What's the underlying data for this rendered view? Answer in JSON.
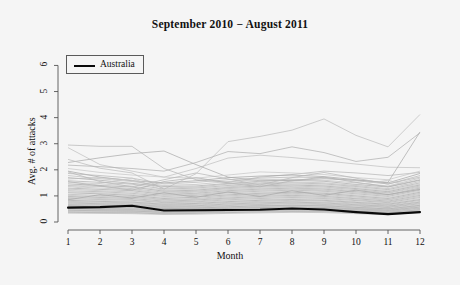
{
  "chart_data": {
    "type": "line",
    "title": "September 2010 − August 2011",
    "xlabel": "Month",
    "ylabel": "Avg. # of attacks",
    "xlim": [
      1,
      12
    ],
    "ylim": [
      0,
      6.4
    ],
    "xticks": [
      "1",
      "2",
      "3",
      "4",
      "5",
      "6",
      "7",
      "8",
      "9",
      "10",
      "11",
      "12"
    ],
    "yticks": [
      "0",
      "1",
      "2",
      "3",
      "4",
      "5",
      "6"
    ],
    "grid": false,
    "legend": {
      "position": "top-left",
      "entries": [
        {
          "name": "Australia",
          "color": "#0a0a0a",
          "width": 2.2
        }
      ]
    },
    "x": [
      1,
      2,
      3,
      4,
      5,
      6,
      7,
      8,
      9,
      10,
      11,
      12
    ],
    "highlight_series": {
      "name": "Australia",
      "color": "#0a0a0a",
      "values": [
        0.55,
        0.57,
        0.62,
        0.44,
        0.45,
        0.46,
        0.47,
        0.52,
        0.48,
        0.38,
        0.3,
        0.38
      ]
    },
    "series": [
      {
        "name": "Country 01",
        "values": [
          2.95,
          2.9,
          2.9,
          2.05,
          1.62,
          1.52,
          1.72,
          1.82,
          1.95,
          1.88,
          1.78,
          1.9
        ]
      },
      {
        "name": "Country 02",
        "values": [
          2.85,
          2.2,
          1.95,
          1.72,
          2.05,
          2.45,
          2.56,
          2.47,
          2.35,
          2.22,
          2.1,
          2.08
        ]
      },
      {
        "name": "Country 03",
        "values": [
          2.28,
          2.46,
          2.62,
          2.72,
          2.2,
          1.72,
          1.58,
          1.6,
          1.66,
          1.6,
          1.52,
          3.45
        ]
      },
      {
        "name": "Country 04",
        "values": [
          2.4,
          2.06,
          1.88,
          1.26,
          1.85,
          3.08,
          3.28,
          3.52,
          3.95,
          3.32,
          2.88,
          4.12
        ]
      },
      {
        "name": "Country 05",
        "values": [
          2.18,
          2.12,
          2.05,
          1.95,
          2.28,
          2.7,
          2.62,
          2.88,
          2.66,
          2.32,
          2.48,
          3.42
        ]
      },
      {
        "name": "Country 06",
        "values": [
          2.05,
          1.9,
          1.8,
          1.72,
          1.68,
          1.8,
          1.92,
          1.88,
          1.82,
          1.7,
          1.62,
          1.95
        ]
      },
      {
        "name": "Country 07",
        "values": [
          1.95,
          1.72,
          1.58,
          1.5,
          1.58,
          1.7,
          1.76,
          1.8,
          1.74,
          1.62,
          1.5,
          1.86
        ]
      },
      {
        "name": "Country 08",
        "values": [
          1.86,
          1.78,
          1.68,
          1.46,
          1.52,
          1.62,
          1.68,
          1.72,
          1.7,
          1.58,
          1.46,
          1.72
        ]
      },
      {
        "name": "Country 09",
        "values": [
          1.78,
          1.66,
          1.55,
          1.4,
          1.44,
          1.55,
          1.62,
          1.64,
          1.6,
          1.5,
          1.38,
          1.68
        ]
      },
      {
        "name": "Country 10",
        "values": [
          1.7,
          1.6,
          1.48,
          1.36,
          1.38,
          1.48,
          1.56,
          1.6,
          1.56,
          1.44,
          1.34,
          1.6
        ]
      },
      {
        "name": "Country 11",
        "values": [
          1.65,
          1.7,
          1.6,
          1.3,
          1.34,
          1.45,
          1.5,
          1.54,
          1.5,
          1.4,
          1.28,
          1.55
        ]
      },
      {
        "name": "Country 12",
        "values": [
          1.58,
          1.52,
          1.45,
          1.26,
          1.3,
          1.4,
          1.46,
          1.5,
          1.46,
          1.36,
          1.24,
          1.5
        ]
      },
      {
        "name": "Country 13",
        "values": [
          1.52,
          1.46,
          1.38,
          1.22,
          1.26,
          1.36,
          1.42,
          1.46,
          1.42,
          1.32,
          1.2,
          1.46
        ]
      },
      {
        "name": "Country 14",
        "values": [
          1.46,
          1.4,
          1.34,
          1.18,
          1.22,
          1.32,
          1.38,
          1.42,
          1.38,
          1.28,
          1.16,
          1.42
        ]
      },
      {
        "name": "Country 15",
        "values": [
          1.4,
          1.36,
          1.28,
          1.14,
          1.18,
          1.28,
          1.34,
          1.38,
          1.34,
          1.24,
          1.12,
          1.38
        ]
      },
      {
        "name": "Country 16",
        "values": [
          1.36,
          1.3,
          1.24,
          1.1,
          1.15,
          1.24,
          1.3,
          1.34,
          1.3,
          1.2,
          1.1,
          1.34
        ]
      },
      {
        "name": "Country 17",
        "values": [
          1.3,
          1.25,
          1.2,
          1.06,
          1.1,
          1.2,
          1.26,
          1.3,
          1.26,
          1.16,
          1.05,
          1.3
        ]
      },
      {
        "name": "Country 18",
        "values": [
          1.26,
          1.2,
          1.15,
          1.02,
          1.06,
          1.16,
          1.22,
          1.26,
          1.22,
          1.12,
          1.02,
          1.26
        ]
      },
      {
        "name": "Country 19",
        "values": [
          1.2,
          1.16,
          1.1,
          0.98,
          1.02,
          1.12,
          1.18,
          1.22,
          1.18,
          1.08,
          0.98,
          1.22
        ]
      },
      {
        "name": "Country 20",
        "values": [
          1.16,
          1.12,
          1.06,
          0.94,
          0.98,
          1.08,
          1.14,
          1.18,
          1.14,
          1.04,
          0.94,
          1.18
        ]
      },
      {
        "name": "Country 21",
        "values": [
          1.12,
          1.08,
          1.02,
          0.9,
          0.95,
          1.04,
          1.1,
          1.14,
          1.1,
          1.0,
          0.9,
          1.14
        ]
      },
      {
        "name": "Country 22",
        "values": [
          1.06,
          1.02,
          0.98,
          0.86,
          0.9,
          1.0,
          1.06,
          1.1,
          1.06,
          0.96,
          0.86,
          1.1
        ]
      },
      {
        "name": "Country 23",
        "values": [
          1.02,
          0.98,
          0.94,
          0.84,
          0.87,
          0.96,
          1.02,
          1.06,
          1.02,
          0.92,
          0.84,
          1.06
        ]
      },
      {
        "name": "Country 24",
        "values": [
          0.98,
          0.94,
          0.9,
          0.8,
          0.84,
          0.92,
          0.98,
          1.02,
          0.98,
          0.89,
          0.8,
          1.02
        ]
      },
      {
        "name": "Country 25",
        "values": [
          0.94,
          0.9,
          0.86,
          0.77,
          0.8,
          0.89,
          0.94,
          0.98,
          0.94,
          0.85,
          0.77,
          0.98
        ]
      },
      {
        "name": "Country 26",
        "values": [
          0.9,
          0.86,
          0.83,
          0.74,
          0.77,
          0.85,
          0.9,
          0.94,
          0.9,
          0.82,
          0.74,
          0.94
        ]
      },
      {
        "name": "Country 27",
        "values": [
          0.86,
          0.83,
          0.79,
          0.71,
          0.74,
          0.82,
          0.86,
          0.9,
          0.87,
          0.78,
          0.71,
          0.9
        ]
      },
      {
        "name": "Country 28",
        "values": [
          0.83,
          0.79,
          0.76,
          0.68,
          0.71,
          0.78,
          0.83,
          0.86,
          0.83,
          0.75,
          0.68,
          0.86
        ]
      },
      {
        "name": "Country 29",
        "values": [
          0.79,
          0.76,
          0.73,
          0.65,
          0.68,
          0.75,
          0.79,
          0.83,
          0.8,
          0.72,
          0.65,
          0.83
        ]
      },
      {
        "name": "Country 30",
        "values": [
          0.76,
          0.73,
          0.7,
          0.63,
          0.65,
          0.72,
          0.76,
          0.79,
          0.76,
          0.69,
          0.62,
          0.79
        ]
      },
      {
        "name": "Country 31",
        "values": [
          0.73,
          0.7,
          0.67,
          0.6,
          0.62,
          0.69,
          0.73,
          0.76,
          0.73,
          0.66,
          0.6,
          0.76
        ]
      },
      {
        "name": "Country 32",
        "values": [
          0.7,
          0.67,
          0.64,
          0.58,
          0.6,
          0.66,
          0.7,
          0.73,
          0.7,
          0.64,
          0.57,
          0.73
        ]
      },
      {
        "name": "Country 33",
        "values": [
          0.67,
          0.64,
          0.62,
          0.55,
          0.57,
          0.63,
          0.67,
          0.7,
          0.67,
          0.61,
          0.55,
          0.7
        ]
      },
      {
        "name": "Country 34",
        "values": [
          0.64,
          0.62,
          0.59,
          0.53,
          0.55,
          0.61,
          0.64,
          0.67,
          0.65,
          0.58,
          0.52,
          0.67
        ]
      },
      {
        "name": "Country 35",
        "values": [
          0.62,
          0.59,
          0.57,
          0.51,
          0.53,
          0.58,
          0.62,
          0.64,
          0.62,
          0.56,
          0.5,
          0.64
        ]
      },
      {
        "name": "Country 36",
        "values": [
          0.59,
          0.57,
          0.55,
          0.49,
          0.51,
          0.56,
          0.59,
          0.62,
          0.6,
          0.54,
          0.48,
          0.62
        ]
      },
      {
        "name": "Country 37",
        "values": [
          0.57,
          0.55,
          0.53,
          0.47,
          0.49,
          0.54,
          0.57,
          0.59,
          0.57,
          0.52,
          0.46,
          0.59
        ]
      },
      {
        "name": "Country 38",
        "values": [
          0.54,
          0.52,
          0.5,
          0.45,
          0.47,
          0.52,
          0.55,
          0.57,
          0.55,
          0.5,
          0.44,
          0.57
        ]
      },
      {
        "name": "Country 39",
        "values": [
          0.52,
          0.5,
          0.48,
          0.43,
          0.45,
          0.5,
          0.52,
          0.54,
          0.53,
          0.48,
          0.42,
          0.54
        ]
      },
      {
        "name": "Country 40",
        "values": [
          0.5,
          0.48,
          0.46,
          0.41,
          0.43,
          0.47,
          0.5,
          0.52,
          0.51,
          0.46,
          0.4,
          0.52
        ]
      },
      {
        "name": "Country 41",
        "values": [
          0.47,
          0.45,
          0.44,
          0.39,
          0.41,
          0.45,
          0.48,
          0.5,
          0.48,
          0.44,
          0.38,
          0.5
        ]
      },
      {
        "name": "Country 42",
        "values": [
          0.45,
          0.43,
          0.42,
          0.37,
          0.39,
          0.43,
          0.45,
          0.47,
          0.46,
          0.42,
          0.36,
          0.47
        ]
      },
      {
        "name": "Country 43",
        "values": [
          0.42,
          0.41,
          0.4,
          0.35,
          0.37,
          0.41,
          0.43,
          0.45,
          0.44,
          0.4,
          0.34,
          0.45
        ]
      },
      {
        "name": "Country 44",
        "values": [
          0.4,
          0.38,
          0.37,
          0.33,
          0.35,
          0.38,
          0.41,
          0.42,
          0.41,
          0.37,
          0.32,
          0.42
        ]
      },
      {
        "name": "Country 45",
        "values": [
          0.37,
          0.36,
          0.35,
          0.31,
          0.33,
          0.36,
          0.38,
          0.4,
          0.39,
          0.35,
          0.3,
          0.4
        ]
      },
      {
        "name": "Country 46",
        "values": [
          0.34,
          0.33,
          0.32,
          0.29,
          0.3,
          0.33,
          0.35,
          0.37,
          0.36,
          0.32,
          0.28,
          0.37
        ]
      },
      {
        "name": "Country 47",
        "values": [
          1.55,
          1.38,
          1.22,
          1.55,
          1.7,
          1.5,
          1.35,
          1.58,
          1.72,
          1.52,
          1.35,
          1.62
        ]
      },
      {
        "name": "Country 48",
        "values": [
          1.25,
          1.48,
          1.68,
          1.2,
          1.1,
          1.32,
          1.55,
          1.35,
          1.18,
          1.42,
          1.6,
          1.3
        ]
      },
      {
        "name": "Country 49",
        "values": [
          0.85,
          1.05,
          0.92,
          1.12,
          0.95,
          1.15,
          0.98,
          1.2,
          1.02,
          1.22,
          1.05,
          1.25
        ]
      },
      {
        "name": "Country 50",
        "values": [
          1.92,
          1.55,
          1.35,
          1.62,
          1.88,
          1.65,
          1.42,
          1.7,
          1.9,
          1.68,
          1.45,
          1.78
        ]
      }
    ]
  }
}
